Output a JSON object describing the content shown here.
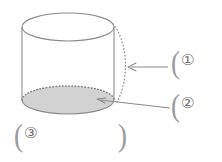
{
  "figure": {
    "background_color": "#ffffff",
    "width": 222,
    "height": 162
  },
  "shape": {
    "name": "cylinder",
    "outline_color": "#8a8a8a",
    "base_fill_color": "#d2d2d2",
    "dashed_color": "#9b9b9b",
    "top_ellipse": {
      "cx": 68,
      "cy": 27,
      "rx": 46,
      "ry": 14
    },
    "bottom_ellipse": {
      "cx": 68,
      "cy": 100,
      "rx": 46,
      "ry": 14
    },
    "left_edge_x": 22,
    "right_edge_x": 114,
    "dashed_arc_label": "lateral-surface-edge"
  },
  "labels": [
    {
      "id": "label-1",
      "open_paren": "(",
      "marker": "①",
      "marker_name": "circled-digit-one",
      "points_to": "lateral-surface-dashed-arc",
      "leader": "arrow-left"
    },
    {
      "id": "label-2",
      "open_paren": "(",
      "marker": "②",
      "marker_name": "circled-digit-two",
      "points_to": "bottom-base-ellipse",
      "leader": "arrow-left"
    },
    {
      "id": "label-3",
      "open_paren": "(",
      "marker": "③",
      "marker_name": "circled-digit-three",
      "close_paren": ")",
      "points_to": "none",
      "leader": "none"
    }
  ]
}
